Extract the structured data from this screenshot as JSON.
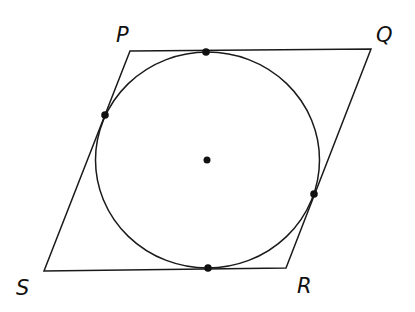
{
  "figure": {
    "labels": {
      "P": "P",
      "Q": "Q",
      "R": "R",
      "S": "S"
    },
    "vertices": {
      "P": [
        130,
        51
      ],
      "Q": [
        371,
        49
      ],
      "R": [
        286,
        268
      ],
      "S": [
        44,
        271
      ]
    },
    "circle": {
      "cx": 207,
      "cy": 160,
      "rx": 112,
      "ry": 108
    },
    "points": [
      {
        "name": "center",
        "x": 207,
        "y": 160
      },
      {
        "name": "tangent-top",
        "x": 206,
        "y": 52
      },
      {
        "name": "tangent-left",
        "x": 105,
        "y": 115
      },
      {
        "name": "tangent-right",
        "x": 314,
        "y": 194
      },
      {
        "name": "tangent-bottom",
        "x": 208,
        "y": 268
      }
    ],
    "stroke_color": "#1a1a1a"
  }
}
